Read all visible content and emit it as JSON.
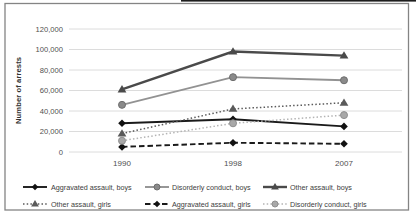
{
  "figure": {
    "background": "#ffffff",
    "border_color": "#848484",
    "gridline_color": "#dcdcdc",
    "tick_label_color": "#4f4f4f",
    "legend_text_color": "#3d3d3d",
    "crop_artifact_color": "#1d1d1d"
  },
  "chart_data": {
    "type": "line",
    "title": "",
    "xlabel": "",
    "ylabel": "Number of arrests",
    "x_categories": [
      "1990",
      "1998",
      "2007"
    ],
    "ylim": [
      0,
      120000
    ],
    "ytick_step": 20000,
    "ytick_labels": [
      "0",
      "20,000",
      "40,000",
      "60,000",
      "80,000",
      "100,000",
      "120,000"
    ],
    "grid": "horizontal",
    "legend_position": "bottom, 2 rows x 3 columns",
    "series": [
      {
        "name": "Aggravated assault, boys",
        "values": [
          28000,
          32000,
          25000
        ],
        "color": "#1a1a1a",
        "line_style": "solid",
        "marker": "diamond",
        "marker_fill": "#121212",
        "marker_stroke": "#121212",
        "stroke_width": 1.9
      },
      {
        "name": "Disorderly conduct, boys",
        "values": [
          46000,
          73000,
          70000
        ],
        "color": "#929292",
        "line_style": "solid",
        "marker": "circle",
        "marker_fill": "#8a8a8a",
        "marker_stroke": "#6e6e6e",
        "stroke_width": 1.9
      },
      {
        "name": "Other assault, boys",
        "values": [
          61000,
          98000,
          94000
        ],
        "color": "#4a4a4a",
        "line_style": "solid",
        "marker": "triangle",
        "marker_fill": "#4a4a4a",
        "marker_stroke": "#4a4a4a",
        "stroke_width": 2.4
      },
      {
        "name": "Other assault, girls",
        "values": [
          18000,
          42000,
          48000
        ],
        "color": "#5a5a5a",
        "line_style": "dotted",
        "marker": "triangle",
        "marker_fill": "#5a5a5a",
        "marker_stroke": "#5a5a5a",
        "stroke_width": 1.5
      },
      {
        "name": "Aggravated assault, girls",
        "values": [
          5000,
          9000,
          8000
        ],
        "color": "#1a1a1a",
        "line_style": "dashed",
        "marker": "diamond",
        "marker_fill": "#121212",
        "marker_stroke": "#121212",
        "stroke_width": 1.9
      },
      {
        "name": "Disorderly conduct, girls",
        "values": [
          11000,
          28000,
          36000
        ],
        "color": "#b4b4b4",
        "line_style": "dotted",
        "marker": "circle",
        "marker_fill": "#a8a8a8",
        "marker_stroke": "#8f8f8f",
        "stroke_width": 1.5
      }
    ],
    "legend_order": [
      0,
      1,
      2,
      3,
      4,
      5
    ]
  }
}
